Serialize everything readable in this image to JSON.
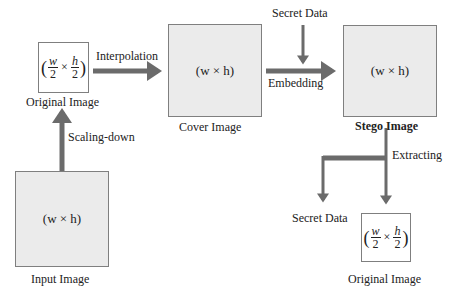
{
  "diagram": {
    "nodes": {
      "original_top": {
        "label": "Original Image",
        "expr": {
          "w": "w",
          "h": "h",
          "den": "2",
          "times": "×",
          "open": "(",
          "close": ")"
        }
      },
      "cover": {
        "label": "Cover Image",
        "expr": "(w × h)"
      },
      "stego": {
        "label": "Stego Image",
        "expr": "(w × h)"
      },
      "input": {
        "label": "Input Image",
        "expr": "(w × h)"
      },
      "original_bottom": {
        "label": "Original Image",
        "expr": {
          "w": "w",
          "h": "h",
          "den": "2",
          "times": "×",
          "open": "(",
          "close": ")"
        }
      },
      "secret_top": {
        "label": "Secret Data"
      },
      "secret_bottom": {
        "label": "Secret Data"
      }
    },
    "edges": {
      "interpolation": "Interpolation",
      "scaling_down": "Scaling-down",
      "embedding": "Embedding",
      "extracting": "Extracting"
    },
    "colors": {
      "arrow": "#6b6b6b",
      "box_fill": "#ebebeb",
      "box_border": "#7f7f7f"
    }
  }
}
